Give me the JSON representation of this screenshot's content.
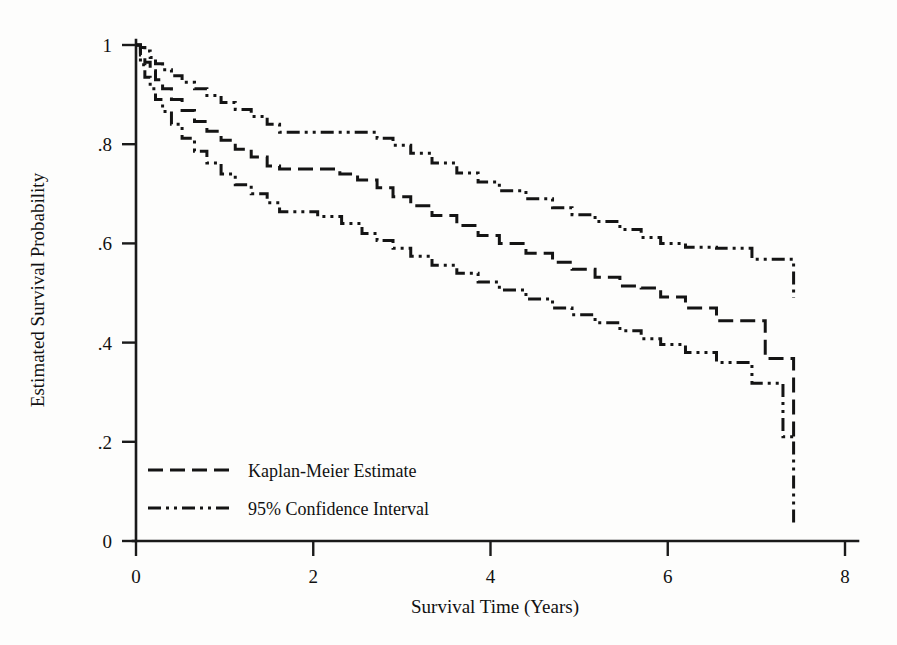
{
  "chart_data": {
    "type": "line",
    "title": "",
    "xlabel": "Survival Time (Years)",
    "ylabel": "Estimated Survival Probability",
    "xlim": [
      0,
      8.2
    ],
    "ylim": [
      0,
      1.04
    ],
    "xticks": [
      "0",
      "2",
      "4",
      "6",
      "8"
    ],
    "xtick_values": [
      0,
      2,
      4,
      6,
      8
    ],
    "yticks": [
      "0",
      ".2",
      ".4",
      ".6",
      ".8",
      "1"
    ],
    "ytick_values": [
      0,
      0.2,
      0.4,
      0.6,
      0.8,
      1.0
    ],
    "grid": false,
    "legend_position": "lower-left-inside",
    "legend": [
      {
        "label": "Kaplan-Meier Estimate",
        "style": "dashed"
      },
      {
        "label": "95% Confidence Interval",
        "style": "dash-dot-dot"
      }
    ],
    "series": [
      {
        "name": "95% Confidence Interval (upper)",
        "style": "dash-dot-dot",
        "step": "post",
        "x": [
          0.0,
          0.05,
          0.1,
          0.16,
          0.22,
          0.3,
          0.4,
          0.52,
          0.66,
          0.8,
          0.96,
          1.12,
          1.3,
          1.48,
          1.62,
          2.55,
          2.72,
          2.9,
          3.1,
          3.34,
          3.62,
          3.86,
          4.1,
          4.4,
          4.7,
          4.92,
          5.18,
          5.46,
          5.7,
          5.92,
          6.2,
          6.55,
          6.95,
          7.2,
          7.42
        ],
        "y": [
          1.0,
          0.995,
          0.988,
          0.975,
          0.962,
          0.95,
          0.938,
          0.925,
          0.912,
          0.898,
          0.884,
          0.87,
          0.856,
          0.84,
          0.824,
          0.824,
          0.812,
          0.798,
          0.782,
          0.762,
          0.742,
          0.724,
          0.706,
          0.69,
          0.672,
          0.658,
          0.644,
          0.628,
          0.612,
          0.6,
          0.592,
          0.59,
          0.568,
          0.568,
          0.49
        ]
      },
      {
        "name": "Kaplan-Meier Estimate",
        "style": "dashed",
        "step": "post",
        "x": [
          0.0,
          0.05,
          0.1,
          0.16,
          0.22,
          0.3,
          0.4,
          0.52,
          0.66,
          0.8,
          0.96,
          1.12,
          1.3,
          1.48,
          1.62,
          2.1,
          2.3,
          2.5,
          2.72,
          2.9,
          3.1,
          3.34,
          3.62,
          3.86,
          4.1,
          4.4,
          4.7,
          4.92,
          5.18,
          5.46,
          5.7,
          5.92,
          6.2,
          6.55,
          6.95,
          7.1,
          7.3,
          7.42
        ],
        "y": [
          1.0,
          0.98,
          0.965,
          0.948,
          0.93,
          0.912,
          0.89,
          0.868,
          0.846,
          0.826,
          0.808,
          0.79,
          0.774,
          0.756,
          0.75,
          0.75,
          0.74,
          0.728,
          0.712,
          0.694,
          0.676,
          0.656,
          0.636,
          0.616,
          0.6,
          0.58,
          0.562,
          0.548,
          0.532,
          0.514,
          0.51,
          0.492,
          0.47,
          0.444,
          0.444,
          0.368,
          0.368,
          0.2
        ]
      },
      {
        "name": "95% Confidence Interval (lower)",
        "style": "dash-dot-dot",
        "step": "post",
        "x": [
          0.0,
          0.05,
          0.1,
          0.16,
          0.22,
          0.3,
          0.4,
          0.52,
          0.66,
          0.8,
          0.96,
          1.12,
          1.3,
          1.48,
          1.62,
          1.86,
          2.05,
          2.32,
          2.55,
          2.72,
          2.9,
          3.1,
          3.34,
          3.62,
          3.86,
          4.1,
          4.4,
          4.7,
          4.92,
          5.18,
          5.46,
          5.7,
          5.92,
          6.2,
          6.55,
          6.95,
          7.1,
          7.3,
          7.42
        ],
        "y": [
          1.0,
          0.96,
          0.935,
          0.912,
          0.89,
          0.866,
          0.84,
          0.812,
          0.786,
          0.762,
          0.74,
          0.718,
          0.7,
          0.682,
          0.664,
          0.664,
          0.654,
          0.64,
          0.62,
          0.606,
          0.59,
          0.574,
          0.556,
          0.54,
          0.522,
          0.506,
          0.488,
          0.47,
          0.456,
          0.44,
          0.424,
          0.408,
          0.396,
          0.38,
          0.36,
          0.318,
          0.318,
          0.21,
          0.03
        ]
      }
    ]
  },
  "axes": {
    "x_title": "Survival Time (Years)",
    "y_title": "Estimated Survival Probability"
  }
}
